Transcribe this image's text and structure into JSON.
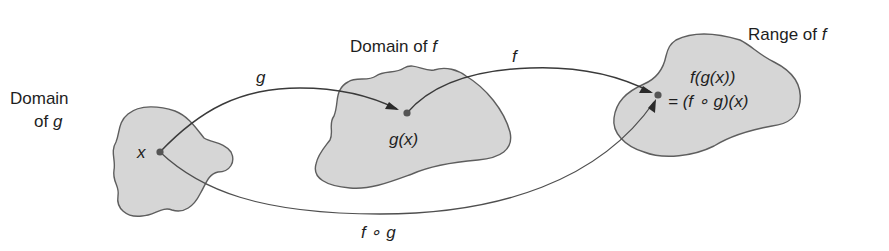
{
  "diagram": {
    "sets": {
      "domain_g": {
        "label_line1": "Domain",
        "label_line2_prefix": "of ",
        "label_line2_var": "g",
        "point_label": "x"
      },
      "domain_f": {
        "label_prefix": "Domain of ",
        "label_var": "f",
        "point_label": "g(x)"
      },
      "range_f": {
        "label_prefix": "Range of ",
        "label_var": "f",
        "point_label_line1": "f(g(x))",
        "point_label_line2": "= (f ∘ g)(x)"
      }
    },
    "arrows": {
      "g": {
        "label": "g",
        "from": "x",
        "to": "g(x)"
      },
      "f": {
        "label": "f",
        "from": "g(x)",
        "to": "f(g(x))"
      },
      "composite": {
        "label": "f ∘ g",
        "from": "x",
        "to": "(f ∘ g)(x)"
      }
    },
    "colors": {
      "blob_fill": "#d6d6d6",
      "blob_stroke": "#5e5e5e",
      "arrow": "#3a3a3a",
      "text": "#1e1e1e",
      "point": "#555555"
    }
  }
}
